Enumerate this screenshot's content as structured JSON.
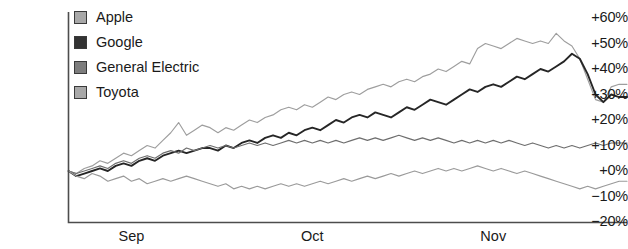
{
  "chart_data": {
    "type": "line",
    "title": "",
    "xlabel": "",
    "ylabel": "",
    "ylim": [
      -20,
      60
    ],
    "ytick_labels": [
      "+60%",
      "+50%",
      "+40%",
      "+30%",
      "+20%",
      "+10%",
      "+0%",
      "−10%",
      "−20%"
    ],
    "ytick_values": [
      60,
      50,
      40,
      30,
      20,
      10,
      0,
      -10,
      -20
    ],
    "xtick_labels": [
      "Sep",
      "Oct",
      "Nov"
    ],
    "xtick_values": [
      8,
      31,
      54
    ],
    "xlim": [
      0,
      72
    ],
    "grid": false,
    "legend_position": "top-left-inside",
    "series": [
      {
        "name": "Apple",
        "color": "#9e9e9e",
        "values": [
          0,
          -1,
          1,
          2,
          4,
          3,
          5,
          7,
          6,
          8,
          10,
          9,
          12,
          15,
          19,
          14,
          16,
          18,
          17,
          15,
          17,
          16,
          18,
          20,
          19,
          21,
          22,
          24,
          25,
          24,
          26,
          25,
          27,
          29,
          28,
          30,
          31,
          30,
          32,
          33,
          34,
          33,
          35,
          36,
          35,
          37,
          38,
          40,
          39,
          41,
          43,
          42,
          48,
          50,
          49,
          48,
          50,
          52,
          51,
          50,
          51,
          50,
          54,
          51,
          49,
          44,
          36,
          28,
          27,
          33,
          34,
          34
        ]
      },
      {
        "name": "Google",
        "color": "#262626",
        "values": [
          0,
          -2,
          -1,
          0,
          1,
          0,
          2,
          3,
          2,
          4,
          5,
          4,
          6,
          7,
          8,
          7,
          8,
          9,
          9,
          8,
          10,
          9,
          11,
          12,
          11,
          13,
          14,
          13,
          15,
          14,
          16,
          17,
          16,
          18,
          20,
          19,
          21,
          22,
          21,
          23,
          22,
          21,
          23,
          25,
          24,
          26,
          28,
          27,
          26,
          28,
          30,
          32,
          31,
          33,
          34,
          33,
          35,
          37,
          36,
          38,
          40,
          39,
          41,
          43,
          46,
          44,
          38,
          30,
          27,
          30,
          29,
          29
        ]
      },
      {
        "name": "General Electric",
        "color": "#6e6e6e",
        "values": [
          0,
          -1,
          0,
          1,
          2,
          1,
          3,
          4,
          3,
          5,
          6,
          5,
          7,
          8,
          7,
          9,
          8,
          9,
          10,
          9,
          10,
          9,
          10,
          11,
          10,
          11,
          10,
          11,
          12,
          11,
          12,
          11,
          12,
          11,
          12,
          11,
          12,
          13,
          12,
          13,
          12,
          13,
          14,
          13,
          12,
          13,
          12,
          13,
          12,
          11,
          12,
          11,
          12,
          11,
          12,
          11,
          12,
          11,
          10,
          11,
          10,
          9,
          10,
          9,
          10,
          9,
          10,
          11,
          10,
          11,
          11,
          11
        ]
      },
      {
        "name": "Toyota",
        "color": "#9a9a9a",
        "values": [
          0,
          -2,
          -3,
          -1,
          -2,
          -4,
          -3,
          -2,
          -4,
          -3,
          -5,
          -4,
          -3,
          -4,
          -3,
          -2,
          -3,
          -4,
          -5,
          -6,
          -5,
          -7,
          -6,
          -7,
          -6,
          -7,
          -6,
          -5,
          -6,
          -5,
          -6,
          -5,
          -4,
          -5,
          -4,
          -3,
          -4,
          -3,
          -2,
          -3,
          -2,
          -1,
          -2,
          -1,
          0,
          -1,
          0,
          1,
          0,
          1,
          0,
          1,
          2,
          1,
          0,
          1,
          0,
          -1,
          0,
          -1,
          -2,
          -3,
          -4,
          -5,
          -6,
          -7,
          -6,
          -7,
          -6,
          -5,
          -4,
          -4
        ]
      }
    ]
  },
  "legend": {
    "items": [
      {
        "label": "Apple",
        "swatch_color": "#a8a8a8"
      },
      {
        "label": "Google",
        "swatch_color": "#333333"
      },
      {
        "label": "General Electric",
        "swatch_color": "#7d7d7d"
      },
      {
        "label": "Toyota",
        "swatch_color": "#a8a8a8"
      }
    ]
  },
  "axis": {
    "spine_color": "#4d4d4d"
  }
}
